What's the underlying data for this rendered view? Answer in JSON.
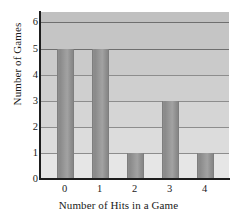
{
  "chart_data": {
    "type": "bar",
    "title": "",
    "xlabel": "Number of Hits in a Game",
    "ylabel": "Number of Games",
    "categories": [
      "0",
      "1",
      "2",
      "3",
      "4"
    ],
    "values": [
      5,
      5,
      1,
      3,
      1
    ],
    "xlim": [
      -0.7,
      4.7
    ],
    "ylim": [
      0,
      6.4
    ],
    "yticks": [
      0,
      1,
      2,
      3,
      4,
      5,
      6
    ],
    "ytick_labels": [
      "0",
      "1",
      "2",
      "3",
      "4",
      "5",
      "6"
    ],
    "xticks": [
      0,
      1,
      2,
      3,
      4
    ],
    "xtick_labels": [
      "0",
      "1",
      "2",
      "3",
      "4"
    ],
    "grid": "horizontal",
    "legend": null,
    "colors": {
      "bar_fill": "#949494",
      "bar_edge": "#7e7e7e",
      "gridline": "#8d8d8d",
      "axis_spine": "#1d1d1d",
      "plot_background_top": "#c2c2c2",
      "plot_background_bottom": "#e4e4e4",
      "figure_background": "#ffffff",
      "text": "#1a1a1a"
    },
    "bands": [
      {
        "from": 6,
        "to": 6.4,
        "color": "#c0c0c0"
      },
      {
        "from": 5,
        "to": 6,
        "color": "#c5c5c5"
      },
      {
        "from": 4,
        "to": 5,
        "color": "#cacaca"
      },
      {
        "from": 3,
        "to": 4,
        "color": "#cfcfcf"
      },
      {
        "from": 2,
        "to": 3,
        "color": "#d5d5d5"
      },
      {
        "from": 1,
        "to": 2,
        "color": "#dcdcdc"
      },
      {
        "from": 0,
        "to": 1,
        "color": "#e6e6e6"
      }
    ]
  }
}
